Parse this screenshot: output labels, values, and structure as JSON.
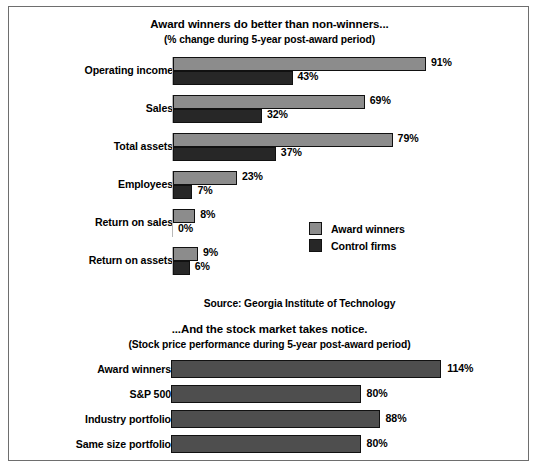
{
  "frame": {
    "border_color": "#6e6e6e",
    "background": "#ffffff"
  },
  "top_chart": {
    "title": "Award winners do better than non-winners...",
    "subtitle": "(% change during 5-year post-award period)",
    "legend": [
      {
        "name": "legend-award-winners",
        "label": "Award winners",
        "color": "#8c8c8c"
      },
      {
        "name": "legend-control-firms",
        "label": "Control firms",
        "color": "#272727"
      }
    ],
    "source": "Source: Georgia Institute of Technology"
  },
  "bottom_chart": {
    "title": "...And the stock market takes notice.",
    "subtitle": "(Stock price performance during 5-year post-award period)"
  },
  "chart_data": [
    {
      "type": "bar",
      "orientation": "horizontal",
      "title": "Award winners do better than non-winners...",
      "subtitle": "(% change during 5-year post-award period)",
      "xlabel": "",
      "ylabel": "",
      "unit": "%",
      "xlim": [
        0,
        100
      ],
      "grid": false,
      "legend_position": "inside-middle-right",
      "annotation": "Source: Georgia Institute of Technology",
      "categories": [
        "Operating income",
        "Sales",
        "Total assets",
        "Employees",
        "Return on sales",
        "Return on assets"
      ],
      "series": [
        {
          "name": "Award winners",
          "color": "#8c8c8c",
          "values": [
            91,
            69,
            79,
            23,
            8,
            9
          ],
          "labels": [
            "91%",
            "69%",
            "79%",
            "23%",
            "8%",
            "9%"
          ]
        },
        {
          "name": "Control firms",
          "color": "#272727",
          "values": [
            43,
            32,
            37,
            7,
            0,
            6
          ],
          "labels": [
            "43%",
            "32%",
            "37%",
            "7%",
            "0%",
            "6%"
          ]
        }
      ]
    },
    {
      "type": "bar",
      "orientation": "horizontal",
      "title": "...And the stock market takes notice.",
      "subtitle": "(Stock price performance during 5-year post-award period)",
      "xlabel": "",
      "ylabel": "",
      "unit": "%",
      "xlim": [
        0,
        120
      ],
      "grid": false,
      "legend_position": "none",
      "categories": [
        "Award winners",
        "S&P 500",
        "Industry portfolio",
        "Same size portfolio"
      ],
      "series": [
        {
          "name": "Stock price performance",
          "color": "#4e4e4e",
          "values": [
            114,
            80,
            88,
            80
          ],
          "labels": [
            "114%",
            "80%",
            "88%",
            "80%"
          ]
        }
      ]
    }
  ]
}
